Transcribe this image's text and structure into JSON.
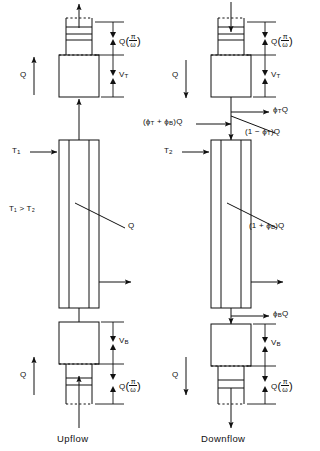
{
  "figure": {
    "type": "engineering-schematic",
    "panels": [
      {
        "id": "upflow",
        "caption": "Upflow",
        "side": "left",
        "labels": {
          "inlet_flow": "Q",
          "outlet_flow": "Q",
          "top_reservoir_volume": "V",
          "top_reservoir_volume_sub": "T",
          "bottom_reservoir_volume": "V",
          "bottom_reservoir_volume_sub": "B",
          "top_capillary_flow_lead": "Q",
          "bottom_capillary_flow_lead": "Q",
          "capillary_fraction_num": "π",
          "capillary_fraction_den": "ω",
          "hot_temperature": "T",
          "hot_temperature_sub": "1",
          "temperature_relation": "T₁ > T₂",
          "column_flow": "Q"
        }
      },
      {
        "id": "downflow",
        "caption": "Downflow",
        "side": "right",
        "labels": {
          "inlet_flow": "Q",
          "outlet_flow": "Q",
          "top_reservoir_volume": "V",
          "top_reservoir_volume_sub": "T",
          "bottom_reservoir_volume": "V",
          "bottom_reservoir_volume_sub": "B",
          "top_capillary_flow_lead": "Q",
          "bottom_capillary_flow_lead": "Q",
          "capillary_fraction_num": "π",
          "capillary_fraction_den": "ω",
          "cold_temperature": "T",
          "cold_temperature_sub": "2",
          "top_side_stream": "ϕ",
          "top_side_stream_sub": "T",
          "top_side_stream_tail": "Q",
          "combined_feed": "(ϕ",
          "combined_feed_sub1": "T",
          "combined_feed_mid": " + ϕ",
          "combined_feed_sub2": "B",
          "combined_feed_tail": ")Q",
          "column_inlet": "(1 − ϕ",
          "column_inlet_sub": "T",
          "column_inlet_tail": ")Q",
          "column_flow": "(1 + ϕ",
          "column_flow_sub": "B",
          "column_flow_tail": ")Q",
          "bottom_side_stream": "ϕ",
          "bottom_side_stream_sub": "B",
          "bottom_side_stream_tail": "Q"
        }
      }
    ],
    "symbols": {
      "flow_rate": "Q",
      "top_split_fraction": "ϕT",
      "bottom_split_fraction": "ϕB",
      "top_volume": "VT",
      "bottom_volume": "VB",
      "period_over_omega": "π/ω"
    },
    "colors": {
      "line": "#111111",
      "background": "#ffffff",
      "text": "#111111"
    }
  }
}
